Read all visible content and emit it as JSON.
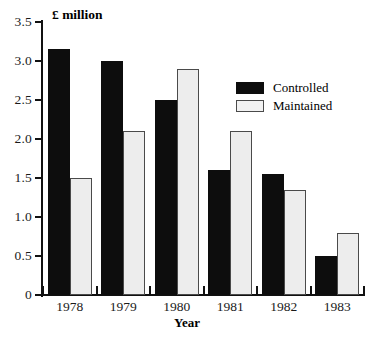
{
  "chart_data": {
    "type": "bar",
    "title": "",
    "subtitle": "",
    "xlabel": "Year",
    "ylabel": "£ million",
    "categories": [
      "1978",
      "1979",
      "1980",
      "1981",
      "1982",
      "1983"
    ],
    "series": [
      {
        "name": "Controlled",
        "color": "#0d0d0d",
        "values": [
          3.15,
          3.0,
          2.5,
          1.6,
          1.55,
          0.5
        ]
      },
      {
        "name": "Maintained",
        "color": "#ededed",
        "values": [
          1.5,
          2.1,
          2.9,
          2.1,
          1.35,
          0.8
        ]
      }
    ],
    "ylim": [
      0,
      3.5
    ],
    "ytick_labels": [
      "0",
      "0.5",
      "1.0",
      "1.5",
      "2.0",
      "2.5",
      "3.0",
      "3.5"
    ],
    "ytick_values": [
      0,
      0.5,
      1.0,
      1.5,
      2.0,
      2.5,
      3.0,
      3.5
    ],
    "grid": false,
    "legend_position": "upper-right",
    "legend": [
      "Controlled",
      "Maintained"
    ]
  },
  "axes": {
    "y_title": "£ million",
    "x_title": "Year"
  },
  "legend": {
    "items": [
      {
        "label": "Controlled"
      },
      {
        "label": "Maintained"
      }
    ]
  }
}
